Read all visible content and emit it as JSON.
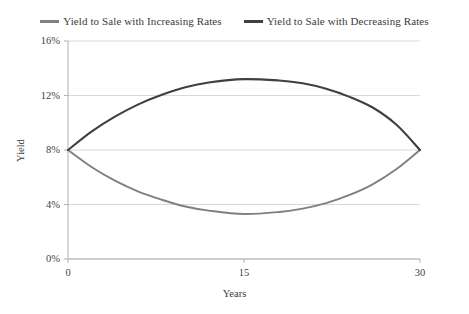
{
  "chart_data": {
    "type": "line",
    "title": "",
    "xlabel": "Years",
    "ylabel": "Yield",
    "xlim": [
      0,
      30
    ],
    "ylim": [
      0,
      16
    ],
    "xticks": [
      "0",
      "15",
      "30"
    ],
    "xtick_values": [
      0,
      15,
      30
    ],
    "yticks": [
      "0%",
      "4%",
      "8%",
      "12%",
      "16%"
    ],
    "ytick_values": [
      0,
      4,
      8,
      12,
      16
    ],
    "grid": true,
    "grid_axis": "y",
    "legend_position": "top-center",
    "series": [
      {
        "name": "Yield to Sale with Increasing Rates",
        "color": "#808084",
        "x": [
          0,
          2,
          4,
          6,
          8,
          10,
          12,
          15,
          18,
          20,
          22,
          24,
          26,
          28,
          30
        ],
        "values": [
          8.0,
          6.75,
          5.75,
          4.95,
          4.35,
          3.85,
          3.55,
          3.3,
          3.45,
          3.7,
          4.1,
          4.7,
          5.5,
          6.6,
          8.0
        ]
      },
      {
        "name": "Yield to Sale with Decreasing Rates",
        "color": "#3f3f44",
        "x": [
          0,
          2,
          4,
          6,
          8,
          10,
          12,
          15,
          18,
          20,
          22,
          24,
          26,
          28,
          30
        ],
        "values": [
          8.0,
          9.35,
          10.45,
          11.35,
          12.05,
          12.6,
          12.95,
          13.2,
          13.1,
          12.9,
          12.5,
          11.9,
          11.1,
          9.85,
          8.0
        ]
      }
    ]
  },
  "legend": {
    "items": [
      {
        "label": "Yield to Sale with Increasing Rates",
        "color": "#808084"
      },
      {
        "label": "Yield to Sale with Decreasing Rates",
        "color": "#3f3f44"
      }
    ]
  },
  "axes": {
    "x_title": "Years",
    "y_title": "Yield",
    "x_tick_labels": [
      "0",
      "15",
      "30"
    ],
    "y_tick_labels": [
      "0%",
      "4%",
      "8%",
      "12%",
      "16%"
    ]
  },
  "style": {
    "background": "#ffffff",
    "grid_color": "#d9d9d9",
    "axis_color": "#b0b0b0",
    "text_color": "#3b3b3b"
  }
}
